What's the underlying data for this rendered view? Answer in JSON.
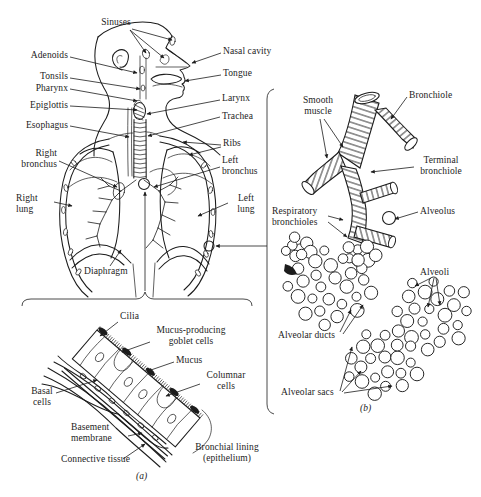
{
  "figure": {
    "colors": {
      "ink": "#1c1c1c",
      "paper": "#ffffff"
    },
    "panel_a_tag": "(a)",
    "panel_b_tag": "(b)",
    "respiratory_system": {
      "labels": {
        "sinuses": "Sinuses",
        "adenoids": "Adenoids",
        "tonsils": "Tonsils",
        "pharynx": "Pharynx",
        "epiglottis": "Epiglottis",
        "esophagus": "Esophagus",
        "right_bronchus": "Right bronchus",
        "right_lung": "Right lung",
        "diaphragm": "Diaphragm",
        "nasal_cavity": "Nasal cavity",
        "tongue": "Tongue",
        "larynx": "Larynx",
        "trachea": "Trachea",
        "ribs": "Ribs",
        "left_bronchus": "Left bronchus",
        "left_lung": "Left lung"
      }
    },
    "bronchial_lining": {
      "labels": {
        "cilia": "Cilia",
        "goblet": "Mucus-producing goblet cells",
        "mucus": "Mucus",
        "columnar": "Columnar cells",
        "basal": "Basal cells",
        "basement": "Basement membrane",
        "connective": "Connective tissue",
        "bronchial_lining": "Bronchial lining (epithelium)"
      }
    },
    "bronchiole_detail": {
      "labels": {
        "smooth_muscle": "Smooth muscle",
        "bronchiole": "Bronchiole",
        "terminal_bronchiole": "Terminal bronchiole",
        "respiratory_bronchioles": "Respiratory bronchioles",
        "alveolus": "Alveolus",
        "alveoli": "Alveoli",
        "alveolar_ducts": "Alveolar ducts",
        "alveolar_sacs": "Alveolar sacs"
      }
    }
  }
}
